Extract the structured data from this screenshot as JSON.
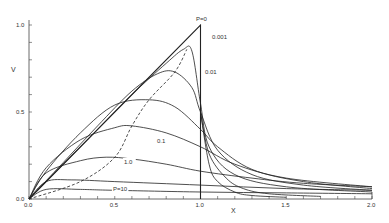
{
  "chart_data": {
    "type": "line",
    "title": "",
    "xlabel": "X",
    "ylabel": "V",
    "xlim": [
      0.0,
      2.0
    ],
    "ylim": [
      0.0,
      1.0
    ],
    "x_ticks": [
      "0.0",
      "0.5",
      "1.0",
      "1.5",
      "2.0"
    ],
    "y_ticks": [
      "0.0",
      "0.5",
      "1.0"
    ],
    "grid": false,
    "legend": "inline curve labels",
    "series": [
      {
        "name": "P = 0",
        "label": "P=0",
        "x": [
          0,
          1.0,
          1.0
        ],
        "y": [
          0,
          1.0,
          0
        ]
      },
      {
        "name": "P = 0.001",
        "label": "0.001",
        "x": [
          0,
          0.2,
          0.4,
          0.6,
          0.8,
          0.9,
          0.95,
          1.0,
          1.05,
          1.2,
          1.5,
          2.0
        ],
        "y": [
          0,
          0.2,
          0.4,
          0.6,
          0.78,
          0.86,
          0.85,
          0.55,
          0.3,
          0.14,
          0.07,
          0.04
        ]
      },
      {
        "name": "P = 0.01",
        "label": "0.01",
        "x": [
          0,
          0.2,
          0.4,
          0.6,
          0.75,
          0.85,
          0.95,
          1.0,
          1.1,
          1.3,
          1.6,
          2.0
        ],
        "y": [
          0,
          0.21,
          0.42,
          0.62,
          0.72,
          0.73,
          0.64,
          0.5,
          0.28,
          0.14,
          0.08,
          0.05
        ]
      },
      {
        "name": "P = 0.1",
        "label": "0.1",
        "x": [
          0,
          0.1,
          0.3,
          0.5,
          0.7,
          0.85,
          1.0,
          1.1,
          1.3,
          1.6,
          2.0
        ],
        "y": [
          0,
          0.16,
          0.38,
          0.54,
          0.57,
          0.53,
          0.4,
          0.3,
          0.17,
          0.1,
          0.06
        ]
      },
      {
        "name": "P = 0.3",
        "label": "",
        "x": [
          0,
          0.1,
          0.3,
          0.5,
          0.6,
          0.8,
          1.0,
          1.2,
          1.5,
          2.0
        ],
        "y": [
          0,
          0.18,
          0.34,
          0.41,
          0.42,
          0.38,
          0.3,
          0.2,
          0.12,
          0.07
        ]
      },
      {
        "name": "P = 1.0",
        "label": "1.0",
        "x": [
          0,
          0.1,
          0.3,
          0.45,
          0.6,
          0.8,
          1.0,
          1.3,
          1.6,
          2.0
        ],
        "y": [
          0,
          0.15,
          0.22,
          0.24,
          0.23,
          0.2,
          0.16,
          0.12,
          0.09,
          0.07
        ]
      },
      {
        "name": "P = 3",
        "label": "",
        "x": [
          0,
          0.1,
          0.25,
          0.5,
          1.0,
          1.5,
          2.0
        ],
        "y": [
          0,
          0.1,
          0.11,
          0.1,
          0.08,
          0.06,
          0.05
        ]
      },
      {
        "name": "P = 10",
        "label": "P=10",
        "x": [
          0,
          0.1,
          0.3,
          0.5,
          1.0,
          1.5,
          2.0
        ],
        "y": [
          0,
          0.055,
          0.055,
          0.05,
          0.04,
          0.035,
          0.03
        ]
      }
    ],
    "dashed_locus": {
      "name": "locus of maxima",
      "x": [
        0,
        0.3,
        0.5,
        0.6,
        0.7,
        0.85,
        0.92
      ],
      "y": [
        0,
        0.1,
        0.24,
        0.42,
        0.57,
        0.73,
        0.86
      ]
    },
    "fast_decay_curves": [
      {
        "x": [
          1.0,
          1.05,
          1.1,
          1.2,
          1.3,
          1.5
        ],
        "y": [
          0.5,
          0.2,
          0.1,
          0.04,
          0.02,
          0.01
        ]
      },
      {
        "x": [
          1.0,
          1.05,
          1.15,
          1.25,
          1.4,
          1.7
        ],
        "y": [
          0.5,
          0.26,
          0.12,
          0.06,
          0.03,
          0.015
        ]
      }
    ]
  }
}
